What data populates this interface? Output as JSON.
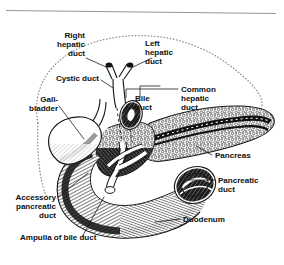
{
  "figure": {
    "style": "black-and-white line illustration with stipple and cross-hatch shading",
    "background_color": "#ffffff",
    "ink_color": "#111111",
    "liver_outline_color": "#8d8d8d",
    "top_rule_color": "#8a8a8a"
  },
  "labels": {
    "right_hepatic_duct": {
      "line1": "Right",
      "line2": "hepatic",
      "line3": "duct"
    },
    "left_hepatic_duct": {
      "line1": "Left",
      "line2": "hepatic",
      "line3": "duct"
    },
    "cystic_duct": {
      "line1": "Cystic duct"
    },
    "gallbladder": {
      "line1": "Gall-",
      "line2": "bladder"
    },
    "bile_duct": {
      "line1": "Bile",
      "line2": "duct"
    },
    "common_hepatic_duct": {
      "line1": "Common",
      "line2": "hepatic",
      "line3": "duct"
    },
    "pancreas": {
      "line1": "Pancreas"
    },
    "pancreatic_duct": {
      "line1": "Pancreatic",
      "line2": "duct"
    },
    "duodenum": {
      "line1": "Duodenum"
    },
    "accessory_pancreatic_duct": {
      "line1": "Accessory",
      "line2": "pancreatic",
      "line3": "duct"
    },
    "ampulla_of_bile_duct": {
      "line1": "Ampulla of bile duct"
    }
  },
  "structures": [
    "liver (dotted silhouette)",
    "right hepatic duct",
    "left hepatic duct",
    "common hepatic duct",
    "cystic duct",
    "gallbladder",
    "bile duct",
    "pancreas",
    "pancreatic duct",
    "accessory pancreatic duct",
    "ampulla of bile duct",
    "duodenum"
  ]
}
